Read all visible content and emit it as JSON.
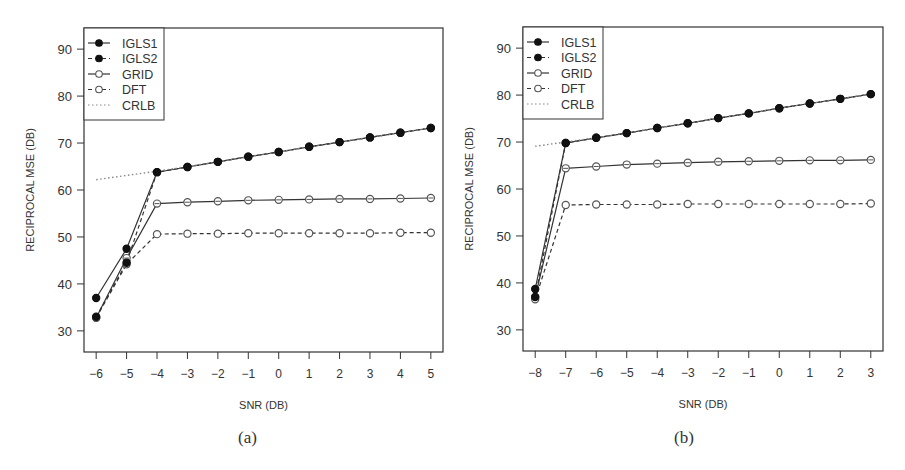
{
  "chart_data": [
    {
      "id": "a",
      "type": "line",
      "caption": "(a)",
      "xlabel": "SNR (DB)",
      "ylabel": "RECIPROCAL MSE (DB)",
      "x": [
        -6,
        -5,
        -4,
        -3,
        -2,
        -1,
        0,
        1,
        2,
        3,
        4,
        5
      ],
      "xticks": [
        "−6",
        "−5",
        "−4",
        "−3",
        "−2",
        "−1",
        "0",
        "1",
        "2",
        "3",
        "4",
        "5"
      ],
      "yticks": [
        30,
        40,
        50,
        60,
        70,
        80,
        90
      ],
      "xlim": [
        -6.4,
        5.4
      ],
      "ylim": [
        25.5,
        94.5
      ],
      "grid": false,
      "legend_position": "top-left",
      "series": [
        {
          "name": "IGLS1",
          "style": "solid",
          "marker": "filled-circle",
          "values": [
            37.0,
            47.5,
            63.8,
            64.9,
            66.0,
            67.1,
            68.1,
            69.2,
            70.2,
            71.2,
            72.2,
            73.2
          ]
        },
        {
          "name": "IGLS2",
          "style": "dashed",
          "marker": "filled-circle",
          "values": [
            33.0,
            44.5,
            63.8,
            64.9,
            66.0,
            67.1,
            68.1,
            69.2,
            70.2,
            71.2,
            72.2,
            73.2
          ]
        },
        {
          "name": "GRID",
          "style": "solid",
          "marker": "open-circle",
          "values": [
            32.8,
            45.5,
            57.1,
            57.4,
            57.6,
            57.8,
            57.9,
            58.0,
            58.1,
            58.1,
            58.2,
            58.3
          ]
        },
        {
          "name": "DFT",
          "style": "dashed",
          "marker": "open-circle",
          "values": [
            32.8,
            44.2,
            50.6,
            50.7,
            50.7,
            50.8,
            50.8,
            50.8,
            50.8,
            50.8,
            50.9,
            50.9
          ]
        },
        {
          "name": "CRLB",
          "style": "dotted",
          "marker": "none",
          "values": [
            62.2,
            63.1,
            64.0,
            65.0,
            66.0,
            67.1,
            68.1,
            69.2,
            70.2,
            71.2,
            72.2,
            73.2
          ]
        }
      ]
    },
    {
      "id": "b",
      "type": "line",
      "caption": "(b)",
      "xlabel": "SNR (DB)",
      "ylabel": "RECIPROCAL MSE (DB)",
      "x": [
        -8,
        -7,
        -6,
        -5,
        -4,
        -3,
        -2,
        -1,
        0,
        1,
        2,
        3
      ],
      "xticks": [
        "−8",
        "−7",
        "−6",
        "−5",
        "−4",
        "−3",
        "−2",
        "−1",
        "0",
        "1",
        "2",
        "3"
      ],
      "yticks": [
        30,
        40,
        50,
        60,
        70,
        80,
        90
      ],
      "xlim": [
        -8.4,
        3.4
      ],
      "ylim": [
        25.5,
        94.5
      ],
      "grid": false,
      "legend_position": "top-left",
      "series": [
        {
          "name": "IGLS1",
          "style": "solid",
          "marker": "filled-circle",
          "values": [
            38.7,
            69.8,
            70.9,
            71.9,
            73.0,
            74.0,
            75.1,
            76.1,
            77.2,
            78.2,
            79.2,
            80.2
          ]
        },
        {
          "name": "IGLS2",
          "style": "dashed",
          "marker": "filled-circle",
          "values": [
            37.0,
            69.8,
            70.9,
            71.9,
            73.0,
            74.0,
            75.1,
            76.1,
            77.2,
            78.2,
            79.2,
            80.2
          ]
        },
        {
          "name": "GRID",
          "style": "solid",
          "marker": "open-circle",
          "values": [
            37.0,
            64.4,
            64.8,
            65.2,
            65.4,
            65.6,
            65.8,
            65.9,
            66.0,
            66.1,
            66.1,
            66.2
          ]
        },
        {
          "name": "DFT",
          "style": "dashed",
          "marker": "open-circle",
          "values": [
            36.5,
            56.6,
            56.7,
            56.7,
            56.7,
            56.8,
            56.8,
            56.8,
            56.8,
            56.8,
            56.8,
            56.9
          ]
        },
        {
          "name": "CRLB",
          "style": "dotted",
          "marker": "none",
          "values": [
            69.1,
            70.0,
            70.9,
            71.9,
            73.0,
            74.0,
            75.1,
            76.1,
            77.2,
            78.2,
            79.2,
            80.2
          ]
        }
      ]
    }
  ],
  "colors": {
    "axis": "#333333",
    "filled_marker": "#111111",
    "open_marker": "#555555",
    "line": "#333333",
    "crlb": "#888888"
  }
}
